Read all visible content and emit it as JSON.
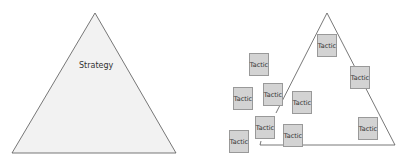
{
  "left_diagram": {
    "label": "Strategy"
  },
  "right_diagram": {
    "tactics": [
      {
        "label": "Tactic",
        "x": 317,
        "y": 34
      },
      {
        "label": "Tactic",
        "x": 249,
        "y": 53
      },
      {
        "label": "Tactic",
        "x": 350,
        "y": 66
      },
      {
        "label": "Tactic",
        "x": 233,
        "y": 87
      },
      {
        "label": "Tactic",
        "x": 263,
        "y": 83
      },
      {
        "label": "Tactic",
        "x": 292,
        "y": 91
      },
      {
        "label": "Tactic",
        "x": 255,
        "y": 116
      },
      {
        "label": "Tactic",
        "x": 358,
        "y": 117
      },
      {
        "label": "Tactic",
        "x": 283,
        "y": 124
      },
      {
        "label": "Tactic",
        "x": 229,
        "y": 130
      }
    ]
  },
  "colors": {
    "triangle_fill": "#f2f2f2",
    "line": "#555555",
    "tactic_fill": "#d3d3d3"
  }
}
